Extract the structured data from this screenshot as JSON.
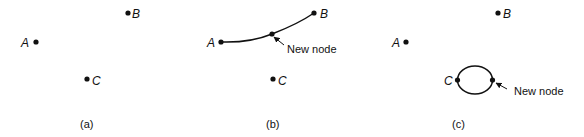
{
  "panels": [
    {
      "caption": "(a)",
      "nodes": [
        {
          "label": "A"
        },
        {
          "label": "B"
        },
        {
          "label": "C"
        }
      ]
    },
    {
      "caption": "(b)",
      "nodes": [
        {
          "label": "A"
        },
        {
          "label": "B"
        },
        {
          "label": "C"
        }
      ],
      "annotation": "New node"
    },
    {
      "caption": "(c)",
      "nodes": [
        {
          "label": "A"
        },
        {
          "label": "B"
        },
        {
          "label": "C"
        }
      ],
      "annotation": "New node"
    }
  ],
  "colors": {
    "ink": "#111111",
    "background": "#ffffff"
  }
}
